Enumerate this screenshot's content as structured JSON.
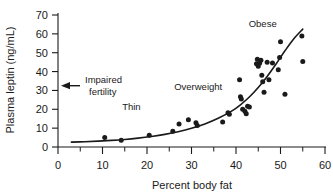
{
  "chart_data": {
    "type": "scatter",
    "title": "",
    "xlabel": "Percent body fat",
    "ylabel": "Plasma leptin (ng/mL)",
    "xlim": [
      0,
      60
    ],
    "ylim": [
      0,
      70
    ],
    "xticks": [
      0,
      10,
      20,
      30,
      40,
      50,
      60
    ],
    "yticks": [
      0,
      10,
      20,
      30,
      40,
      50,
      60,
      70
    ],
    "x_minor_tick_step": 5,
    "grid": false,
    "legend": null,
    "series": [
      {
        "name": "subjects",
        "type": "scatter",
        "marker": "filled-circle",
        "color": "#1a1a1a",
        "points": [
          [
            10.5,
            5.0
          ],
          [
            14.2,
            3.6
          ],
          [
            20.5,
            6.2
          ],
          [
            25.8,
            8.4
          ],
          [
            27.2,
            12.2
          ],
          [
            29.3,
            14.4
          ],
          [
            31.0,
            12.8
          ],
          [
            31.3,
            11.4
          ],
          [
            37.0,
            13.3
          ],
          [
            38.2,
            18.2
          ],
          [
            38.5,
            17.4
          ],
          [
            40.8,
            35.6
          ],
          [
            41.0,
            26.6
          ],
          [
            41.2,
            25.4
          ],
          [
            41.5,
            20.0
          ],
          [
            42.0,
            19.0
          ],
          [
            42.3,
            17.6
          ],
          [
            42.6,
            21.6
          ],
          [
            43.0,
            21.2
          ],
          [
            44.6,
            44.2
          ],
          [
            44.8,
            46.6
          ],
          [
            45.0,
            42.8
          ],
          [
            45.3,
            44.4
          ],
          [
            45.6,
            46.0
          ],
          [
            45.8,
            38.0
          ],
          [
            46.0,
            34.6
          ],
          [
            46.3,
            29.0
          ],
          [
            47.0,
            45.0
          ],
          [
            47.4,
            35.6
          ],
          [
            48.2,
            44.6
          ],
          [
            49.5,
            41.0
          ],
          [
            49.8,
            47.4
          ],
          [
            50.0,
            55.8
          ],
          [
            51.0,
            28.0
          ],
          [
            54.8,
            58.8
          ],
          [
            55.0,
            45.4
          ]
        ]
      },
      {
        "name": "exponential fit",
        "type": "line",
        "color": "#1a1a1a",
        "points": [
          [
            3.0,
            2.6
          ],
          [
            6.0,
            2.8
          ],
          [
            9.0,
            3.1
          ],
          [
            12.0,
            3.5
          ],
          [
            15.0,
            4.0
          ],
          [
            18.0,
            4.7
          ],
          [
            21.0,
            5.6
          ],
          [
            24.0,
            6.7
          ],
          [
            27.0,
            8.1
          ],
          [
            30.0,
            9.9
          ],
          [
            33.0,
            12.2
          ],
          [
            36.0,
            15.2
          ],
          [
            39.0,
            19.0
          ],
          [
            41.0,
            22.4
          ],
          [
            43.0,
            26.5
          ],
          [
            45.0,
            31.5
          ],
          [
            47.0,
            37.4
          ],
          [
            49.0,
            44.0
          ],
          [
            51.0,
            51.0
          ],
          [
            53.0,
            57.4
          ],
          [
            55.0,
            62.5
          ]
        ]
      }
    ],
    "annotations": [
      {
        "name": "thin",
        "text": "Thin",
        "x": 16.5,
        "y": 19.5,
        "anchor": "middle"
      },
      {
        "name": "overweight",
        "text": "Overweight",
        "x": 31.5,
        "y": 30.5,
        "anchor": "middle"
      },
      {
        "name": "obese",
        "text": "Obese",
        "x": 46.0,
        "y": 63.5,
        "anchor": "middle"
      },
      {
        "name": "impaired-fertility",
        "text_line_1": "Impaired",
        "text_line_2": "fertility",
        "y_value": 32.5,
        "arrow": "left-arrow"
      }
    ]
  },
  "axes": {
    "x_title": "Percent body fat",
    "y_title": "Plasma leptin (ng/mL)",
    "x_tick_labels": [
      "0",
      "10",
      "20",
      "30",
      "40",
      "50",
      "60"
    ],
    "y_tick_labels": [
      "0",
      "10",
      "20",
      "30",
      "40",
      "50",
      "60",
      "70"
    ]
  },
  "annotations_text": {
    "thin": "Thin",
    "overweight": "Overweight",
    "obese": "Obese",
    "impaired_line1": "Impaired",
    "impaired_line2": "fertility"
  },
  "colors": {
    "ink": "#1a1a1a",
    "background": "#ffffff"
  }
}
